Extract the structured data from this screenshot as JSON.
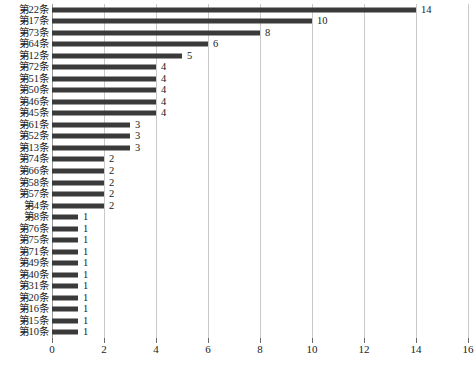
{
  "chart_data": {
    "type": "bar",
    "orientation": "horizontal",
    "title": "",
    "xlabel": "",
    "ylabel": "",
    "xlim": [
      0,
      16
    ],
    "xticks": [
      0,
      2,
      4,
      6,
      8,
      10,
      12,
      14,
      16
    ],
    "grid": true,
    "legend": false,
    "bar_color": "#3a3a3a",
    "gridline_color": "#c9c9c9",
    "categories": [
      "第22条",
      "第17条",
      "第73条",
      "第64条",
      "第12条",
      "第72条",
      "第51条",
      "第50条",
      "第46条",
      "第45条",
      "第61条",
      "第52条",
      "第13条",
      "第74条",
      "第66条",
      "第58条",
      "第57条",
      "第4条",
      "第8条",
      "第76条",
      "第75条",
      "第71条",
      "第49条",
      "第40条",
      "第31条",
      "第20条",
      "第16条",
      "第15条",
      "第10条"
    ],
    "values": [
      14,
      10,
      8,
      6,
      5,
      4,
      4,
      4,
      4,
      4,
      3,
      3,
      3,
      2,
      2,
      2,
      2,
      2,
      1,
      1,
      1,
      1,
      1,
      1,
      1,
      1,
      1,
      1,
      1
    ],
    "data_labels": [
      "14",
      "10",
      "8",
      "6",
      "5",
      "4",
      "4",
      "4",
      "4",
      "4",
      "3",
      "3",
      "3",
      "2",
      "2",
      "2",
      "2",
      "2",
      "1",
      "1",
      "1",
      "1",
      "1",
      "1",
      "1",
      "1",
      "1",
      "1",
      "1"
    ]
  },
  "caption": {
    "text": ""
  }
}
